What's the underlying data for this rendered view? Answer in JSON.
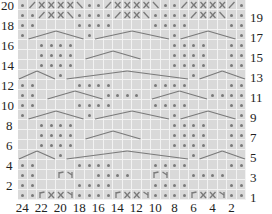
{
  "chart_data": {
    "type": "table",
    "title": "",
    "columns": 24,
    "rows": 20,
    "row_labels_left": [
      "20",
      "18",
      "16",
      "14",
      "12",
      "10",
      "8",
      "6",
      "4",
      "2"
    ],
    "row_labels_right": [
      "19",
      "17",
      "15",
      "13",
      "11",
      "9",
      "7",
      "5",
      "3",
      "1"
    ],
    "col_labels_bottom": [
      "24",
      "22",
      "20",
      "18",
      "16",
      "14",
      "12",
      "10",
      "8",
      "6",
      "4",
      "2"
    ],
    "grid": {
      "20": "o/xxxx\\oo/xxxx\\oo/xxxx/o",
      "19": "oo/xx\\oooo/xx\\oooo/xx\\oo",
      "18": "oo....oooo....oooo....oo",
      "17": "oCCCCCCoCCCCCCCCoCCCCCCo",
      "16": "..oooo..........oooo..oo",
      "15": "..oooo.CCCCCC...oooo..oo",
      "14": "..oooo..........oooo..oo",
      "13": "CCCCoCCCCCCCCCCCCCoCCCCC",
      "12": "oo....oooo....oooo....oo",
      "11": "oo.CCCCCCoooo.CCCCCCoooo",
      "10": "oo....oooo....oooo....oo",
      "9": "oCCCCCCoCCCCCCCCoCCCCCCo",
      "8": "..oooo..........oooo..oo",
      "7": "..oooo.CCCCCC...oooo..oo",
      "6": "..oooo..........oooo..oo",
      "5": "CCCCoCCCCCCCCCCCCCoCCCCC",
      "4": "oo....oooo....oooo....oo",
      "3": "oo..ry..oooo..ry..oooo..",
      "2": "oo....oooo....oooo....oo",
      "1": "oorxxyoooorxxyoooorxxyoo"
    },
    "cell_color": "#d9d9d9",
    "grid_line_color": "#f2f2f2",
    "symbol_color": "#7a7a7a"
  }
}
